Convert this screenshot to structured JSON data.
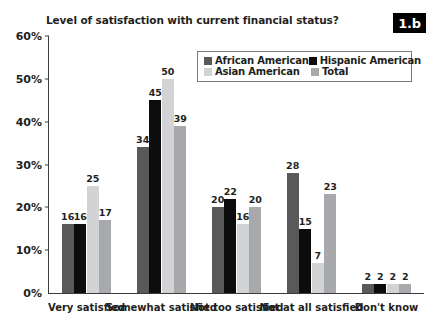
{
  "figure": {
    "badge": "1.b",
    "title": "Level of satisfaction with current financial status?"
  },
  "legend": {
    "entries": [
      {
        "label": "African American",
        "color": "#58595b"
      },
      {
        "label": "Hispanic American",
        "color": "#0d0d0d"
      },
      {
        "label": "Asian American",
        "color": "#d2d3d5"
      },
      {
        "label": "Total",
        "color": "#a7a9ac"
      }
    ]
  },
  "axes": {
    "y_ticks": [
      "60%",
      "50%",
      "40%",
      "30%",
      "20%",
      "10%",
      "0%"
    ],
    "y_values": [
      60,
      50,
      40,
      30,
      20,
      10,
      0
    ],
    "y_min": 0,
    "y_max": 60
  },
  "chart_data": {
    "type": "bar",
    "title": "Level of satisfaction with current financial status?",
    "xlabel": "",
    "ylabel": "",
    "ylim": [
      0,
      60
    ],
    "grid": false,
    "legend_position": "top-right",
    "categories": [
      "Very satisfied",
      "Somewhat satisfied",
      "Not too satisfied",
      "Not at all satisfied",
      "Don't know"
    ],
    "series": [
      {
        "name": "African American",
        "color": "#58595b",
        "values": [
          16,
          34,
          20,
          28,
          2
        ]
      },
      {
        "name": "Hispanic American",
        "color": "#0d0d0d",
        "values": [
          16,
          45,
          22,
          15,
          2
        ]
      },
      {
        "name": "Asian American",
        "color": "#d2d3d5",
        "values": [
          25,
          50,
          16,
          7,
          2
        ]
      },
      {
        "name": "Total",
        "color": "#a7a9ac",
        "values": [
          17,
          39,
          20,
          23,
          2
        ]
      }
    ]
  }
}
